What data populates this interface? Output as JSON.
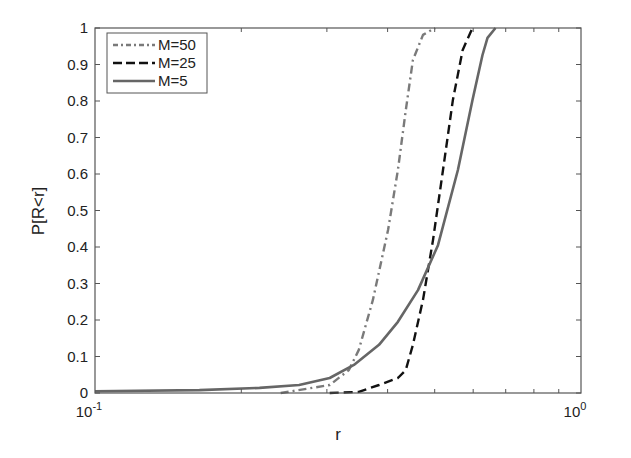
{
  "chart_data": {
    "type": "line",
    "title": "",
    "xlabel": "r",
    "ylabel": "P[R<r]",
    "xscale": "log",
    "xlim": [
      0.1,
      1.0
    ],
    "ylim": [
      0,
      1
    ],
    "grid": false,
    "legend_position": "upper left",
    "xticks": [
      {
        "base": "10",
        "exp": "-1",
        "value": 0.1
      },
      {
        "base": "10",
        "exp": "0",
        "value": 1.0
      }
    ],
    "yticks": [
      "0",
      "0.1",
      "0.2",
      "0.3",
      "0.4",
      "0.5",
      "0.6",
      "0.7",
      "0.8",
      "0.9",
      "1"
    ],
    "series": [
      {
        "name": "M=50",
        "style": "dash-dot",
        "color": "#7a7a7a",
        "points": [
          [
            0.241,
            0.0
          ],
          [
            0.304,
            0.022
          ],
          [
            0.333,
            0.063
          ],
          [
            0.349,
            0.118
          ],
          [
            0.373,
            0.255
          ],
          [
            0.401,
            0.447
          ],
          [
            0.42,
            0.611
          ],
          [
            0.436,
            0.775
          ],
          [
            0.451,
            0.912
          ],
          [
            0.473,
            0.981
          ],
          [
            0.501,
            1.0
          ]
        ]
      },
      {
        "name": "M=25",
        "style": "dashed",
        "color": "#111111",
        "points": [
          [
            0.304,
            0.0
          ],
          [
            0.349,
            0.003
          ],
          [
            0.384,
            0.022
          ],
          [
            0.42,
            0.041
          ],
          [
            0.436,
            0.063
          ],
          [
            0.451,
            0.132
          ],
          [
            0.473,
            0.255
          ],
          [
            0.496,
            0.419
          ],
          [
            0.52,
            0.611
          ],
          [
            0.545,
            0.803
          ],
          [
            0.571,
            0.94
          ],
          [
            0.598,
            1.0
          ]
        ]
      },
      {
        "name": "M=5",
        "style": "solid",
        "color": "#666666",
        "points": [
          [
            0.1,
            0.005
          ],
          [
            0.164,
            0.008
          ],
          [
            0.218,
            0.014
          ],
          [
            0.263,
            0.022
          ],
          [
            0.304,
            0.041
          ],
          [
            0.341,
            0.077
          ],
          [
            0.384,
            0.132
          ],
          [
            0.42,
            0.195
          ],
          [
            0.462,
            0.282
          ],
          [
            0.508,
            0.405
          ],
          [
            0.558,
            0.611
          ],
          [
            0.598,
            0.803
          ],
          [
            0.627,
            0.926
          ],
          [
            0.642,
            0.973
          ],
          [
            0.667,
            1.0
          ]
        ]
      }
    ]
  }
}
